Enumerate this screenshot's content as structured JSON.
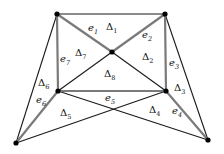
{
  "diagram": {
    "title": "",
    "vertices": {
      "A": [
        57,
        14
      ],
      "B": [
        165,
        14
      ],
      "C": [
        112,
        52
      ],
      "D": [
        58,
        91
      ],
      "E": [
        166,
        91
      ],
      "F": [
        16,
        143
      ],
      "G": [
        208,
        140
      ]
    },
    "edges_black": [
      [
        "A",
        "B"
      ],
      [
        "C",
        "D"
      ],
      [
        "C",
        "E"
      ],
      [
        "A",
        "F"
      ],
      [
        "B",
        "G"
      ],
      [
        "F",
        "E"
      ],
      [
        "D",
        "G"
      ]
    ],
    "edges_gray": [
      {
        "id": "e1",
        "from": "A",
        "to": "C"
      },
      {
        "id": "e2",
        "from": "C",
        "to": "B"
      },
      {
        "id": "e3",
        "from": "B",
        "to": "E"
      },
      {
        "id": "e4",
        "from": "E",
        "to": "G"
      },
      {
        "id": "e5",
        "from": "D",
        "to": "E"
      },
      {
        "id": "e6",
        "from": "D",
        "to": "F"
      },
      {
        "id": "e7",
        "from": "A",
        "to": "D"
      }
    ],
    "edge_labels": [
      {
        "base": "e",
        "sub": "1",
        "x": 88,
        "y": 31
      },
      {
        "base": "e",
        "sub": "2",
        "x": 142,
        "y": 38
      },
      {
        "base": "e",
        "sub": "3",
        "x": 169,
        "y": 66
      },
      {
        "base": "e",
        "sub": "4",
        "x": 172,
        "y": 114
      },
      {
        "base": "e",
        "sub": "5",
        "x": 105,
        "y": 101
      },
      {
        "base": "e",
        "sub": "6",
        "x": 36,
        "y": 103
      },
      {
        "base": "e",
        "sub": "7",
        "x": 60,
        "y": 62
      }
    ],
    "triangle_labels": [
      {
        "base": "Δ",
        "sub": "1",
        "x": 106,
        "y": 30
      },
      {
        "base": "Δ",
        "sub": "2",
        "x": 142,
        "y": 60
      },
      {
        "base": "Δ",
        "sub": "3",
        "x": 174,
        "y": 91
      },
      {
        "base": "Δ",
        "sub": "4",
        "x": 149,
        "y": 113
      },
      {
        "base": "Δ",
        "sub": "5",
        "x": 60,
        "y": 116
      },
      {
        "base": "Δ",
        "sub": "6",
        "x": 38,
        "y": 86
      },
      {
        "base": "Δ",
        "sub": "7",
        "x": 75,
        "y": 56
      },
      {
        "base": "Δ",
        "sub": "8",
        "x": 104,
        "y": 77
      }
    ],
    "colors": {
      "black_edge": "#1a1a1a",
      "gray_edge": "#7a7a7a",
      "vertex": "#000000"
    }
  }
}
